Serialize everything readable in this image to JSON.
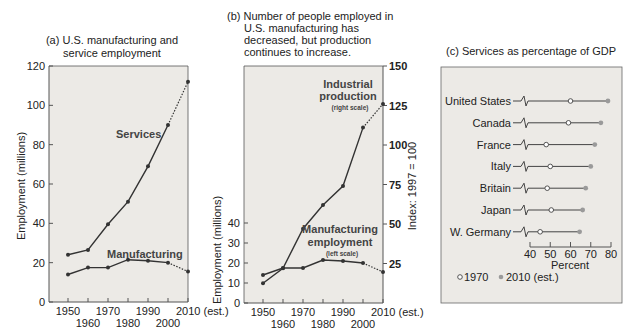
{
  "chart_data": [
    {
      "id": "a",
      "type": "line",
      "title": "(a) U.S. manufacturing and service employment",
      "title_lines": [
        "(a) U.S. manufacturing and",
        "service employment"
      ],
      "xlabel": "",
      "ylabel": "Employment (millions)",
      "x": [
        1950,
        1960,
        1970,
        1980,
        1990,
        2000,
        2010
      ],
      "x_tick_labels": [
        "1950",
        "1960",
        "1970",
        "1980",
        "1990",
        "2000",
        "2010 (est.)"
      ],
      "ylim": [
        0,
        120
      ],
      "y_ticks": [
        0,
        20,
        40,
        60,
        80,
        100,
        120
      ],
      "grid": false,
      "note": "Last segment (2000–2010) dashed: estimate",
      "series": [
        {
          "name": "Services",
          "values": [
            24,
            26.5,
            39.5,
            51,
            69,
            90,
            112
          ]
        },
        {
          "name": "Manufacturing",
          "values": [
            14,
            17.5,
            17.5,
            21.5,
            21,
            20,
            15.5
          ]
        }
      ]
    },
    {
      "id": "b",
      "type": "line",
      "title": "(b) Number of people employed in U.S. manufacturing has decreased, but production continues to increase.",
      "title_lines": [
        "(b) Number of people employed in",
        "U.S. manufacturing has",
        "decreased, but production",
        "continues to increase."
      ],
      "ylabel": "Employment (millions)",
      "ylabel_right": "Index: 1997 = 100",
      "x": [
        1950,
        1960,
        1970,
        1980,
        1990,
        2000,
        2010
      ],
      "x_tick_labels": [
        "1950",
        "1960",
        "1970",
        "1980",
        "1990",
        "2000",
        "2010 (est.)"
      ],
      "ylim_left": [
        0,
        40
      ],
      "y_ticks_left": [
        0,
        10,
        20,
        30,
        40
      ],
      "ylim_right": [
        0,
        150
      ],
      "y_ticks_right": [
        25,
        50,
        75,
        100,
        125,
        150
      ],
      "grid": false,
      "series": [
        {
          "name": "Industrial production",
          "sublabel": "(right scale)",
          "axis": "right",
          "values": [
            12.5,
            22,
            47,
            62,
            74,
            111,
            126
          ]
        },
        {
          "name": "Manufacturing employment",
          "sublabel": "(left scale)",
          "axis": "left",
          "values": [
            14,
            17.5,
            17.5,
            21.5,
            21,
            20,
            15.5
          ]
        }
      ]
    },
    {
      "id": "c",
      "type": "scatter",
      "subtype": "dot-plot",
      "title": "(c) Services as percentage of GDP",
      "xlabel": "Percent",
      "xlim": [
        40,
        80
      ],
      "x_ticks": [
        40,
        50,
        60,
        70,
        80
      ],
      "axis_break": true,
      "legend": [
        {
          "label": "1970",
          "marker": "open-circle"
        },
        {
          "label": "2010 (est.)",
          "marker": "gray-dot"
        }
      ],
      "legend_position": "bottom-left",
      "categories": [
        "United States",
        "Canada",
        "France",
        "Italy",
        "Britain",
        "Japan",
        "W. Germany"
      ],
      "series": [
        {
          "name": "1970",
          "values": [
            60,
            59,
            48,
            50,
            48.5,
            50.5,
            45
          ]
        },
        {
          "name": "2010 (est.)",
          "values": [
            78.5,
            75,
            72,
            70,
            67.5,
            66,
            64.5
          ]
        }
      ]
    }
  ],
  "colors": {
    "panel_bg": "#eceae6",
    "line": "#333333",
    "point_2010": "#9a9a9a",
    "frame": "#555555"
  }
}
